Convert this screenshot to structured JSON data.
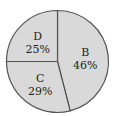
{
  "chart_data": {
    "type": "pie",
    "title": "",
    "categories": [
      "B",
      "C",
      "D"
    ],
    "values": [
      46,
      29,
      25
    ],
    "labels": [
      "B\n46%",
      "C\n29%",
      "D\n25%"
    ],
    "colors": [
      "#d9d9d9",
      "#d9d9d9",
      "#d9d9d9"
    ],
    "slices": [
      {
        "label": "B",
        "value_label": "46%",
        "value": 46
      },
      {
        "label": "C",
        "value_label": "29%",
        "value": 29
      },
      {
        "label": "D",
        "value_label": "25%",
        "value": 25
      }
    ]
  }
}
